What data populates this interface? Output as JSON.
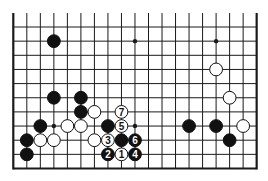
{
  "diagram": {
    "type": "go-board-fragment",
    "board_size": 19,
    "visible_rows": 11,
    "grid": {
      "x0": 13.3,
      "dx": 13.52,
      "cols": 19,
      "y_bottom": 168.5,
      "dy": 14.15,
      "rows": 11,
      "line_top_extent": 13
    },
    "hoshi": [
      {
        "col": 3,
        "row": 1
      },
      {
        "col": 9,
        "row": 1
      },
      {
        "col": 15,
        "row": 1
      },
      {
        "col": 3,
        "row": 7
      },
      {
        "col": 9,
        "row": 7
      },
      {
        "col": 15,
        "row": 7
      }
    ],
    "stones": [
      {
        "color": "black",
        "col": 3,
        "row": 1,
        "label": ""
      },
      {
        "color": "white",
        "col": 15,
        "row": 3,
        "label": ""
      },
      {
        "color": "black",
        "col": 3,
        "row": 5,
        "label": ""
      },
      {
        "color": "black",
        "col": 5,
        "row": 5,
        "label": ""
      },
      {
        "color": "white",
        "col": 16,
        "row": 5,
        "label": ""
      },
      {
        "color": "black",
        "col": 5,
        "row": 6,
        "label": ""
      },
      {
        "color": "white",
        "col": 6,
        "row": 6,
        "label": ""
      },
      {
        "color": "white",
        "col": 8,
        "row": 6,
        "label": "7"
      },
      {
        "color": "black",
        "col": 2,
        "row": 7,
        "label": ""
      },
      {
        "color": "white",
        "col": 4,
        "row": 7,
        "label": ""
      },
      {
        "color": "white",
        "col": 5,
        "row": 7,
        "label": ""
      },
      {
        "color": "black",
        "col": 7,
        "row": 7,
        "label": ""
      },
      {
        "color": "white",
        "col": 8,
        "row": 7,
        "label": "5"
      },
      {
        "color": "black",
        "col": 13,
        "row": 7,
        "label": ""
      },
      {
        "color": "black",
        "col": 15,
        "row": 7,
        "label": ""
      },
      {
        "color": "white",
        "col": 17,
        "row": 7,
        "label": ""
      },
      {
        "color": "black",
        "col": 1,
        "row": 8,
        "label": ""
      },
      {
        "color": "white",
        "col": 2,
        "row": 8,
        "label": ""
      },
      {
        "color": "white",
        "col": 3,
        "row": 8,
        "label": ""
      },
      {
        "color": "white",
        "col": 6,
        "row": 8,
        "label": ""
      },
      {
        "color": "white",
        "col": 7,
        "row": 8,
        "label": "3"
      },
      {
        "color": "black",
        "col": 8,
        "row": 8,
        "label": ""
      },
      {
        "color": "black",
        "col": 9,
        "row": 8,
        "label": "6"
      },
      {
        "color": "black",
        "col": 16,
        "row": 8,
        "label": ""
      },
      {
        "color": "black",
        "col": 1,
        "row": 9,
        "label": ""
      },
      {
        "color": "black",
        "col": 7,
        "row": 9,
        "label": "2"
      },
      {
        "color": "white",
        "col": 8,
        "row": 9,
        "label": "1"
      },
      {
        "color": "black",
        "col": 9,
        "row": 9,
        "label": "4"
      }
    ],
    "colors": {
      "line": "#1a1a1a",
      "black_stone": "#111111",
      "white_stone": "#ffffff",
      "background": "#ffffff"
    }
  }
}
